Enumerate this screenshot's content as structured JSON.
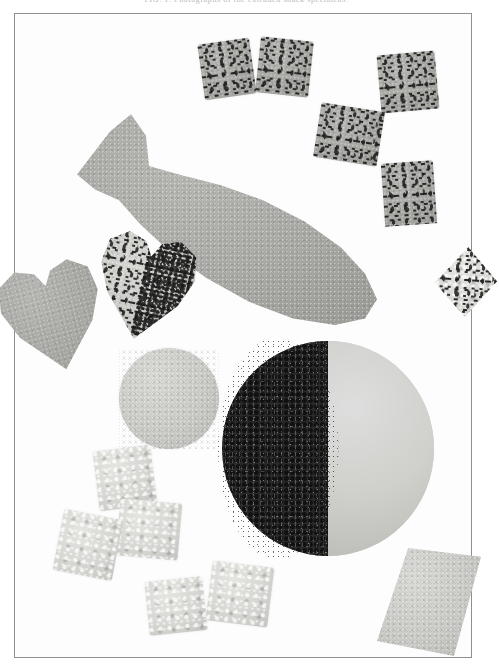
{
  "figure": {
    "caption": "FIG. 1.  Photographs of the extruded snack specimens.",
    "caption_color": "#b9b9b9",
    "frame": {
      "label": "plate-frame",
      "border_color": "#8f8f8f",
      "background_color": "#fdfdfd",
      "x": 14,
      "y": 13,
      "width": 458,
      "height": 645
    },
    "palette": {
      "background": "#ffffff",
      "specimen_mid_gray": "#a8a8a4",
      "specimen_light_gray": "#cfcfca",
      "specimen_pale_gray": "#d8d8d4",
      "specimen_dark_fleck": "#2a2a2a",
      "frame_line": "#8f8f8f"
    },
    "specimens": [
      {
        "id": "cube-top-left",
        "name": "speckled-cube",
        "shape": "cube",
        "tone": "mid",
        "flecked": true,
        "x": 186,
        "y": 27,
        "w": 52,
        "h": 56,
        "rotate": -8
      },
      {
        "id": "cube-top-center",
        "name": "speckled-cube",
        "shape": "cube",
        "tone": "mid",
        "flecked": true,
        "x": 243,
        "y": 25,
        "w": 53,
        "h": 56,
        "rotate": 6
      },
      {
        "id": "cube-top-right",
        "name": "speckled-cube",
        "shape": "cube",
        "tone": "mid",
        "flecked": true,
        "x": 364,
        "y": 39,
        "w": 58,
        "h": 58,
        "rotate": -5
      },
      {
        "id": "cube-upper-mid",
        "name": "speckled-cube",
        "shape": "cube",
        "tone": "mid",
        "flecked": true,
        "x": 302,
        "y": 93,
        "w": 64,
        "h": 55,
        "rotate": 9
      },
      {
        "id": "cube-right-mid",
        "name": "speckled-cube",
        "shape": "cube",
        "tone": "mid",
        "flecked": true,
        "x": 368,
        "y": 148,
        "w": 52,
        "h": 63,
        "rotate": -4
      },
      {
        "id": "fish",
        "name": "fish-shaped-specimen",
        "shape": "fish",
        "tone": "mid",
        "flecked": false,
        "x": 62,
        "y": 96,
        "w": 300,
        "h": 215,
        "rotate": 0
      },
      {
        "id": "heart-flecked",
        "name": "heart-shaped-specimen-flecked",
        "shape": "heart",
        "tone": "light",
        "flecked": true,
        "x": 80,
        "y": 218,
        "w": 100,
        "h": 108,
        "rotate": 12
      },
      {
        "id": "heart-edge",
        "name": "heart-shaped-specimen",
        "shape": "heart",
        "tone": "mid",
        "flecked": false,
        "x": -14,
        "y": 247,
        "w": 104,
        "h": 110,
        "rotate": -14
      },
      {
        "id": "diamond-right",
        "name": "diamond-shaped-specimen",
        "shape": "diamond",
        "tone": "pale",
        "flecked": true,
        "x": 420,
        "y": 233,
        "w": 62,
        "h": 70,
        "rotate": 4
      },
      {
        "id": "disc-small",
        "name": "round-disc-specimen",
        "shape": "disc",
        "tone": "light",
        "flecked": false,
        "x": 104,
        "y": 334,
        "w": 100,
        "h": 101,
        "rotate": 0
      },
      {
        "id": "ball-half-dark",
        "name": "half-coated-sphere-specimen",
        "shape": "sphere-half-dark",
        "tone": "light",
        "flecked": false,
        "x": 207,
        "y": 327,
        "w": 212,
        "h": 215,
        "rotate": 0
      },
      {
        "id": "cube-bl-1",
        "name": "crystalline-cube",
        "shape": "cube",
        "tone": "pale",
        "flecked": false,
        "x": 81,
        "y": 434,
        "w": 58,
        "h": 60,
        "rotate": -7
      },
      {
        "id": "cube-bl-2",
        "name": "crystalline-cube",
        "shape": "cube",
        "tone": "pale",
        "flecked": false,
        "x": 103,
        "y": 487,
        "w": 62,
        "h": 57,
        "rotate": 5
      },
      {
        "id": "cube-bl-3",
        "name": "crystalline-cube",
        "shape": "cube",
        "tone": "pale",
        "flecked": false,
        "x": 43,
        "y": 500,
        "w": 60,
        "h": 62,
        "rotate": 11
      },
      {
        "id": "cube-b-1",
        "name": "crystalline-cube",
        "shape": "cube",
        "tone": "pale",
        "flecked": false,
        "x": 132,
        "y": 565,
        "w": 58,
        "h": 54,
        "rotate": -6
      },
      {
        "id": "cube-b-2",
        "name": "crystalline-cube",
        "shape": "cube",
        "tone": "pale",
        "flecked": false,
        "x": 194,
        "y": 550,
        "w": 62,
        "h": 60,
        "rotate": 7
      },
      {
        "id": "rhomb-bottom-right",
        "name": "rhombus-shaped-specimen",
        "shape": "rhomb",
        "tone": "light",
        "flecked": false,
        "x": 362,
        "y": 534,
        "w": 104,
        "h": 108,
        "rotate": 0
      }
    ]
  }
}
